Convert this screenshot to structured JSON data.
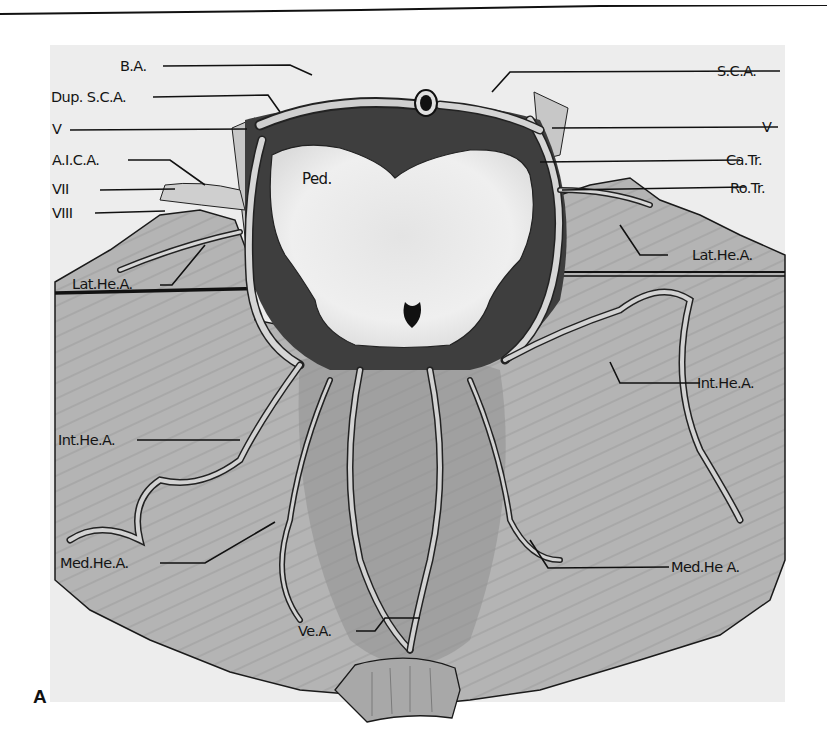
{
  "figure": {
    "panel_label": "A",
    "center_label": "Ped.",
    "labels_left": [
      {
        "id": "ba",
        "text": "B.A."
      },
      {
        "id": "dup-sca",
        "text": "Dup. S.C.A."
      },
      {
        "id": "v-left",
        "text": "V"
      },
      {
        "id": "aica",
        "text": "A.I.C.A."
      },
      {
        "id": "vii",
        "text": "VII"
      },
      {
        "id": "viii",
        "text": "VIII"
      },
      {
        "id": "lat-he-a-left",
        "text": "Lat.He.A."
      },
      {
        "id": "int-he-a-left",
        "text": "Int.He.A."
      },
      {
        "id": "med-he-a-left",
        "text": "Med.He.A."
      },
      {
        "id": "ve-a",
        "text": "Ve.A."
      }
    ],
    "labels_right": [
      {
        "id": "sca",
        "text": "S.C.A."
      },
      {
        "id": "v-right",
        "text": "V"
      },
      {
        "id": "ca-tr",
        "text": "Ca.Tr."
      },
      {
        "id": "ro-tr",
        "text": "Ro.Tr."
      },
      {
        "id": "lat-he-a-right",
        "text": "Lat.He.A."
      },
      {
        "id": "int-he-a-right",
        "text": "Int.He.A."
      },
      {
        "id": "med-he-a-right",
        "text": "Med.He A."
      }
    ],
    "colors": {
      "background": "#ededed",
      "tissue": "#b9b9b9",
      "tissue_dark": "#8a8a8a",
      "brainstem": "#ececec",
      "vessel": "#d8d8d8",
      "outline": "#1a1a1a"
    }
  }
}
